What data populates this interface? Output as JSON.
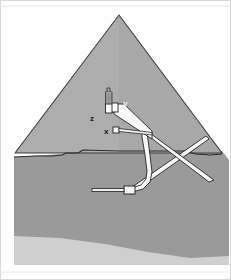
{
  "figure": {
    "name": "pyramid-cross-section",
    "background_color": "#ffffff",
    "border_color": "#d9d9d9"
  },
  "labels": [
    {
      "id": "z",
      "text": "z",
      "x": 90,
      "y": 118,
      "color": "#1a1a1a"
    },
    {
      "id": "y",
      "text": "y",
      "x": 124,
      "y": 103,
      "color": "#f2f2f2"
    },
    {
      "id": "x",
      "text": "x",
      "x": 105,
      "y": 133,
      "color": "#1a1a1a"
    }
  ],
  "colors": {
    "pyramid_fill": "#a8a8a8",
    "pyramid_outline": "#3d3d3d",
    "bedrock_fill": "#9a9a9a",
    "bedrock_lower_fill": "#cfcfcf",
    "sky_fill": "#ffffff",
    "passage_fill": "#f7f7f7",
    "passage_outline": "#262626",
    "chamber_fill": "#fafafa",
    "shaft_fill": "#3a3a3a"
  },
  "geometry": {
    "pyramid_apex": {
      "x": 119,
      "y": 15
    },
    "pyramid_base_left": {
      "x": 15,
      "y": 155
    },
    "pyramid_base_right": {
      "x": 222,
      "y": 155
    },
    "ground_line_y": 157,
    "image_width": 231,
    "image_height": 280
  },
  "elements": {
    "grand_gallery": "sloping-white-passage",
    "kings_chamber": "chamber-y",
    "queens_chamber": "chamber-x",
    "air_shaft": "stepped-shaft-z",
    "subterranean_chamber": "underground-chamber",
    "descending_passage": "long-diagonal-passage",
    "ascending_passage": "short-diagonal-passage"
  }
}
